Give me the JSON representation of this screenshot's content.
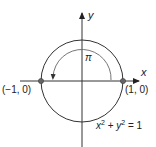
{
  "diagram": {
    "axes": {
      "x_label": "x",
      "y_label": "y"
    },
    "circle": {
      "equation_x": "x",
      "equation_x_exp": "2",
      "equation_plus": " + ",
      "equation_y": "y",
      "equation_y_exp": "2",
      "equation_rhs": " = 1"
    },
    "points": [
      {
        "label": "(−1, 0)",
        "x": -1,
        "y": 0
      },
      {
        "label": "(1, 0)",
        "x": 1,
        "y": 0
      }
    ],
    "rotation_arc": {
      "label": "π",
      "from_angle": 0,
      "to_angle": "π",
      "direction": "counterclockwise"
    },
    "colors": {
      "line": "#333333",
      "arc": "#555555",
      "point": "#555555",
      "text": "#222222"
    }
  }
}
